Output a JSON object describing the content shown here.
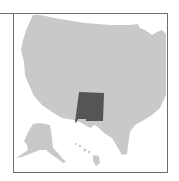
{
  "map": {
    "title": "",
    "highlighted_region": "New Mexico",
    "colors": {
      "land": "#c9c9c9",
      "highlight": "#555555",
      "frame": "#6f6f6f",
      "background": "#ffffff"
    },
    "regions": [
      "Contiguous United States",
      "Alaska",
      "Hawaii",
      "New Mexico"
    ]
  }
}
